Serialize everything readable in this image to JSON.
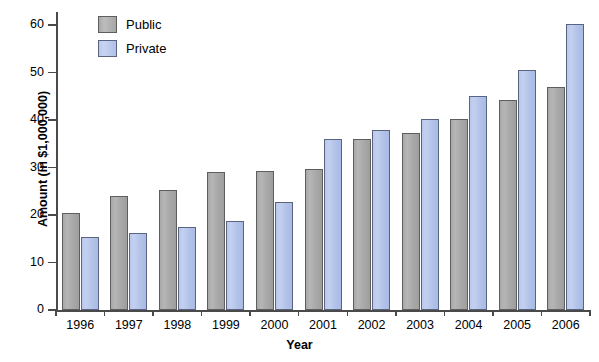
{
  "chart_data": {
    "type": "bar",
    "title": "",
    "xlabel": "Year",
    "ylabel": "Amount (in $1,000,000)",
    "categories": [
      "1996",
      "1997",
      "1998",
      "1999",
      "2000",
      "2001",
      "2002",
      "2003",
      "2004",
      "2005",
      "2006"
    ],
    "series": [
      {
        "name": "Public",
        "color": "#a9a9a9",
        "values": [
          20.5,
          24.0,
          25.2,
          29.0,
          29.2,
          29.7,
          36.0,
          37.2,
          40.2,
          44.2,
          47.0
        ]
      },
      {
        "name": "Private",
        "color": "#b3c3ea",
        "values": [
          15.3,
          16.3,
          17.5,
          18.8,
          22.8,
          36.0,
          37.8,
          40.2,
          45.0,
          50.5,
          60.3
        ]
      }
    ],
    "ylim": [
      0,
      62
    ],
    "yticks": [
      0,
      10,
      20,
      30,
      40,
      50,
      60
    ],
    "ytick_labels": [
      "0",
      "10",
      "20",
      "30",
      "40",
      "50",
      "60"
    ],
    "grid": false,
    "legend_position": "top-left-inside"
  },
  "legend": {
    "entries": [
      {
        "label": "Public",
        "swatch": "public"
      },
      {
        "label": "Private",
        "swatch": "private"
      }
    ]
  },
  "axes": {
    "y_title": "Amount (in $1,000,000)",
    "x_title": "Year"
  }
}
